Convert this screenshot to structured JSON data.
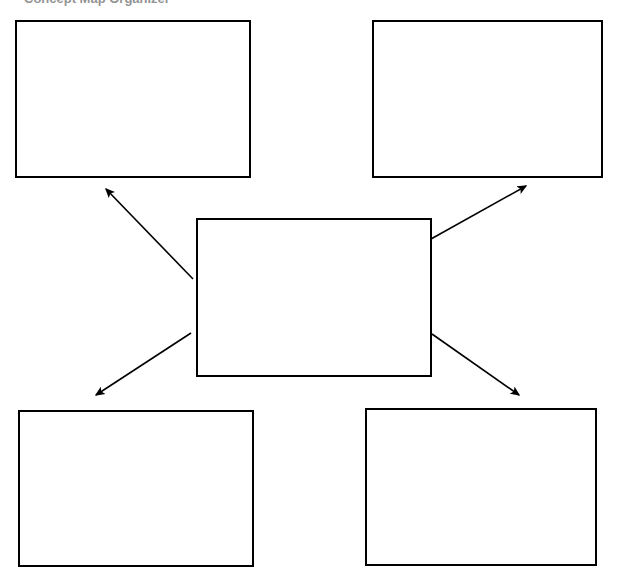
{
  "page": {
    "background_color": "#ffffff",
    "width": 617,
    "height": 585,
    "header_text_fragment": "Concept Map Organizer"
  },
  "diagram": {
    "type": "concept-map",
    "line_color": "#000000",
    "box_fill": "#ffffff",
    "box_border_color": "#000000",
    "box_border_width": 2,
    "center": {
      "name": "center-node",
      "label": "",
      "x": 196,
      "y": 218,
      "width": 236,
      "height": 159
    },
    "nodes": [
      {
        "name": "node-top-left",
        "label": "",
        "x": 15,
        "y": 20,
        "width": 236,
        "height": 158
      },
      {
        "name": "node-top-right",
        "label": "",
        "x": 372,
        "y": 20,
        "width": 231,
        "height": 158
      },
      {
        "name": "node-bottom-left",
        "label": "",
        "x": 18,
        "y": 410,
        "width": 236,
        "height": 157
      },
      {
        "name": "node-bottom-right",
        "label": "",
        "x": 365,
        "y": 408,
        "width": 232,
        "height": 158
      }
    ],
    "connectors": [
      {
        "name": "connector-center-to-top-left",
        "from": "center-node",
        "to": "node-top-left",
        "x1": 193,
        "y1": 279,
        "x2": 104,
        "y2": 187,
        "arrowhead": "end"
      },
      {
        "name": "connector-center-to-top-right",
        "from": "center-node",
        "to": "node-top-right",
        "x1": 431,
        "y1": 239,
        "x2": 528,
        "y2": 184,
        "arrowhead": "end"
      },
      {
        "name": "connector-center-to-bottom-left",
        "from": "center-node",
        "to": "node-bottom-left",
        "x1": 191,
        "y1": 333,
        "x2": 94,
        "y2": 397,
        "arrowhead": "end"
      },
      {
        "name": "connector-center-to-bottom-right",
        "from": "center-node",
        "to": "node-bottom-right",
        "x1": 432,
        "y1": 334,
        "x2": 521,
        "y2": 397,
        "arrowhead": "end"
      }
    ]
  }
}
